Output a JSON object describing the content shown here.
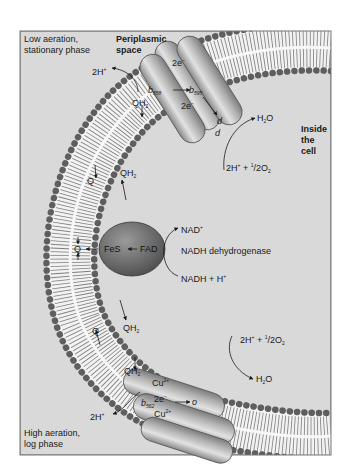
{
  "figure": {
    "background": "#d9d9d9",
    "frame_color": "#777777",
    "head_group_color": "#5e5e5e",
    "protein_color": "#a8a8a8",
    "fes_color": "#6f6f6f"
  },
  "regions": {
    "top_left": "Low aeration,",
    "top_left_2": "stationary phase",
    "periplasm": "Periplasmic",
    "periplasm_2": "space",
    "inside": "Inside",
    "inside_2": "the",
    "inside_3": "cell",
    "bottom_left": "High aeration,",
    "bottom_left_2": "log phase"
  },
  "top_oxidase": {
    "proton": "2H",
    "proton_sup": "+",
    "electrons_top": "2e",
    "electrons_top_sup": "−",
    "b1": "b",
    "b1_sub": "558",
    "b2": "b",
    "b2_sub": "595",
    "electrons_mid": "2e",
    "electrons_mid_sup": "−",
    "d1": "d",
    "d2": "d",
    "water": "H",
    "water_sub": "2",
    "water_o": "O",
    "oxygen_in": "2H",
    "oxygen_in_sup": "+",
    "oxygen_half": " + ",
    "oxygen_frac_num": "1",
    "oxygen_frac": "/2O",
    "oxygen_sub": "2"
  },
  "quinones": {
    "qh2_top": "QH",
    "qh2_top_sub": "2",
    "q_upper": "Q",
    "qh2_upper": "QH",
    "qh2_upper_sub": "2",
    "q_middle": "Q",
    "q_lower": "Q",
    "qh2_lower": "QH",
    "qh2_lower_sub": "2",
    "qh2_bottom": "QH",
    "qh2_bottom_sub": "2"
  },
  "dehydrogenase": {
    "fes": "FeS",
    "fad": "FAD",
    "nad": "NAD",
    "nad_sup": "+",
    "name": "NADH dehydrogenase",
    "nadh": "NADH + H",
    "nadh_sup": "+"
  },
  "bottom_oxidase": {
    "cu_top": "Cu",
    "cu_top_sup": "2+",
    "electrons": "2e",
    "electrons_sup": "−",
    "b": "b",
    "b_sub": "562",
    "o": "o",
    "cu_bottom": "Cu",
    "cu_bottom_sup": "2+",
    "proton": "2H",
    "proton_sup": "+",
    "oxygen_in": "2H",
    "oxygen_in_sup": "+",
    "oxygen_half": " + ",
    "oxygen_frac_num": "1",
    "oxygen_frac": "/2O",
    "oxygen_sub": "2",
    "water": "H",
    "water_sub": "2",
    "water_o": "O"
  }
}
